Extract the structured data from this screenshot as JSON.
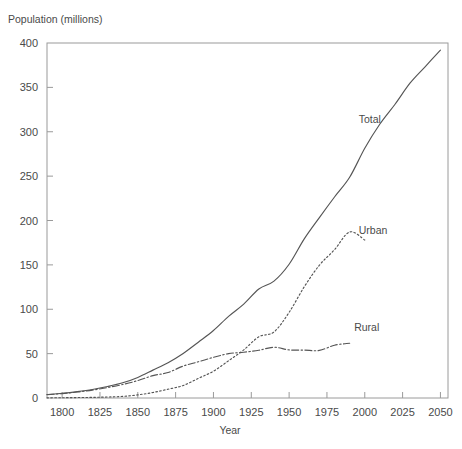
{
  "chart_data": {
    "type": "line",
    "title": "",
    "ylabel": "Population (millions)",
    "xlabel": "Year",
    "xlim": [
      1790,
      2055
    ],
    "ylim": [
      0,
      400
    ],
    "xticks": [
      1800,
      1825,
      1850,
      1875,
      1900,
      1925,
      1950,
      1975,
      2000,
      2025,
      2050
    ],
    "yticks": [
      0,
      50,
      100,
      150,
      200,
      250,
      300,
      350,
      400
    ],
    "grid": false,
    "legend_position": "inline-right",
    "annotations": [
      {
        "text": "Total",
        "x": 1996,
        "y": 310
      },
      {
        "text": "Urban",
        "x": 1996,
        "y": 185
      },
      {
        "text": "Rural",
        "x": 1993,
        "y": 75
      }
    ],
    "series": [
      {
        "name": "Total",
        "style": "solid",
        "x": [
          1790,
          1800,
          1810,
          1820,
          1830,
          1840,
          1850,
          1860,
          1870,
          1880,
          1890,
          1900,
          1910,
          1920,
          1930,
          1940,
          1950,
          1960,
          1970,
          1980,
          1990,
          2000,
          2010,
          2020,
          2030,
          2040,
          2050
        ],
        "y": [
          3.9,
          5.3,
          7.2,
          9.6,
          12.9,
          17.1,
          23.2,
          31.4,
          39.8,
          50.2,
          62.9,
          76.0,
          92.0,
          105.7,
          122.8,
          131.7,
          150.7,
          179.3,
          203.3,
          226.5,
          248.7,
          281.4,
          308.7,
          331.0,
          355.0,
          373.5,
          392.0
        ]
      },
      {
        "name": "Urban",
        "style": "dotted",
        "x": [
          1790,
          1800,
          1810,
          1820,
          1830,
          1840,
          1850,
          1860,
          1870,
          1880,
          1890,
          1900,
          1910,
          1920,
          1930,
          1940,
          1950,
          1960,
          1970,
          1980,
          1990,
          2000
        ],
        "y": [
          0.2,
          0.3,
          0.5,
          0.7,
          1.1,
          1.8,
          3.5,
          6.2,
          9.9,
          14.1,
          22.1,
          30.2,
          42.0,
          54.2,
          69.0,
          74.4,
          96.5,
          125.3,
          149.6,
          167.1,
          187.1,
          178.0
        ]
      },
      {
        "name": "Rural",
        "style": "dash-dot",
        "x": [
          1790,
          1800,
          1810,
          1820,
          1830,
          1840,
          1850,
          1860,
          1870,
          1880,
          1890,
          1900,
          1910,
          1920,
          1930,
          1940,
          1950,
          1960,
          1970,
          1980,
          1990
        ],
        "y": [
          3.7,
          5.0,
          6.7,
          8.9,
          11.8,
          15.2,
          19.6,
          25.2,
          28.7,
          36.0,
          40.8,
          45.8,
          50.0,
          51.6,
          53.8,
          57.2,
          54.2,
          54.0,
          53.6,
          59.5,
          61.7
        ]
      }
    ]
  },
  "plot": {
    "left": 47,
    "right": 448,
    "top": 43,
    "bottom": 398
  }
}
